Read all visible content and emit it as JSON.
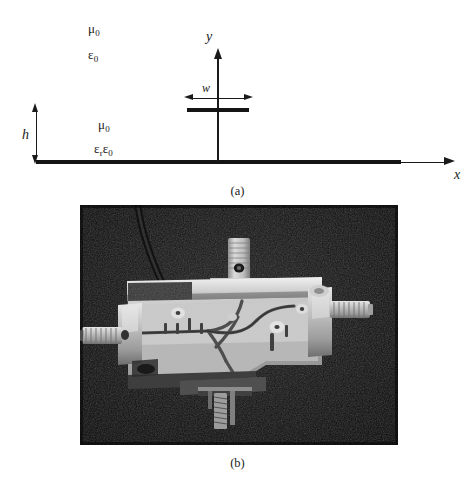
{
  "figure": {
    "panels": [
      {
        "id": "a",
        "caption": "(a)",
        "type": "cross-section-diagram",
        "description": "Microstrip transmission line cross section"
      },
      {
        "id": "b",
        "caption": "(b)",
        "type": "photograph",
        "description": "Photograph of fabricated microstrip circuit with SMA connectors"
      }
    ]
  },
  "diagram": {
    "region_air": {
      "permeability": "μ",
      "permeability_sub": "0",
      "permittivity": "ε",
      "permittivity_sub": "0"
    },
    "region_substrate": {
      "permeability": "μ",
      "permeability_sub": "0",
      "permittivity_prefix": "ε",
      "permittivity_prefix_sub": "r",
      "permittivity": "ε",
      "permittivity_sub": "0"
    },
    "axes": {
      "x_label": "x",
      "y_label": "y"
    },
    "dimensions": {
      "height_label": "h",
      "width_label": "w"
    },
    "colors": {
      "conductor": "#141414",
      "line": "#1a1a1a",
      "background": "#ffffff"
    }
  },
  "photo": {
    "alt": "Grayscale photograph of a microstrip circuit mounted in a metal test fixture with three SMA coaxial connectors",
    "colors": {
      "background": "#0a0a0a",
      "metal_light": "#d8d8d8",
      "metal_mid": "#9a9a9a",
      "metal_dark": "#4a4a4a",
      "board": "#b9b9b9"
    },
    "parts": [
      "sma-connector-left",
      "sma-connector-right",
      "sma-connector-top",
      "sma-connector-bottom",
      "metal-housing",
      "microstrip-board",
      "coaxial-cable"
    ]
  }
}
